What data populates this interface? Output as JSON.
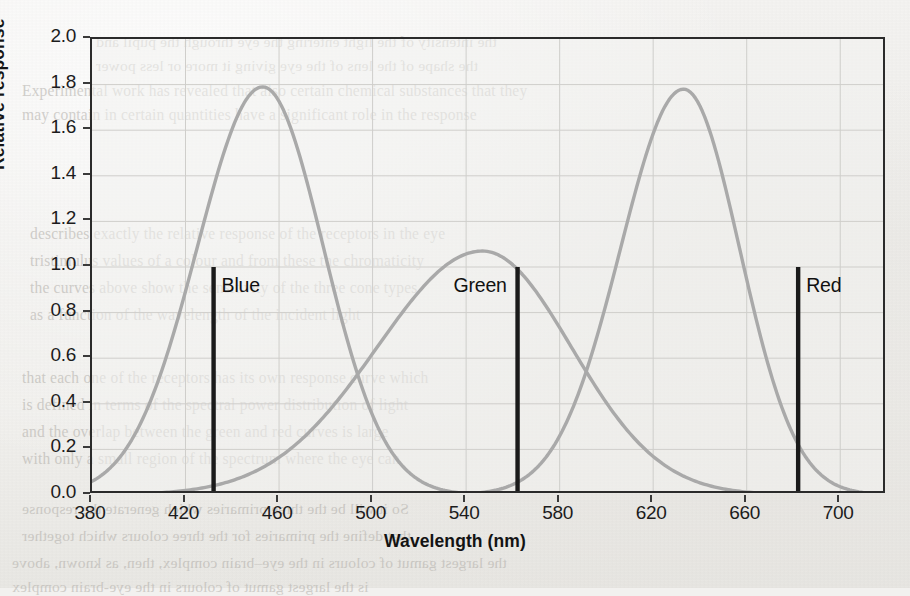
{
  "page": {
    "background_color": "#f1f0ed",
    "ghost_text_color": "#b9b6b1",
    "bleed_lines": [
      {
        "text": "the intensity of the light entering the eye through the pupil and",
        "x": 96,
        "y": 33,
        "flip": true
      },
      {
        "text": "the shape of the lens of the eye giving it more or less power",
        "x": 96,
        "y": 57,
        "flip": true
      },
      {
        "text": "Experimental work has revealed that also certain chemical substances that they",
        "x": 22,
        "y": 82,
        "flip": false
      },
      {
        "text": "may contain in certain quantities have a significant role in the response",
        "x": 22,
        "y": 106,
        "flip": false
      },
      {
        "text": "describes exactly the relative response of the receptors in the eye",
        "x": 30,
        "y": 225,
        "flip": false
      },
      {
        "text": "tristimulus values of a colour and from these the chromaticity",
        "x": 30,
        "y": 252,
        "flip": false
      },
      {
        "text": "the curves above show the sensitivity of the three cone types",
        "x": 30,
        "y": 279,
        "flip": false
      },
      {
        "text": "as a function of the wavelength of the incident light",
        "x": 30,
        "y": 306,
        "flip": false
      },
      {
        "text": "that each one of the receptors has its own response curve which",
        "x": 22,
        "y": 369,
        "flip": false
      },
      {
        "text": "is defined in terms of the spectral power distribution of light",
        "x": 22,
        "y": 396,
        "flip": false
      },
      {
        "text": "and the overlap between the green and red curves is large",
        "x": 22,
        "y": 423,
        "flip": false
      },
      {
        "text": "with only a small region of the spectrum where the eye can",
        "x": 22,
        "y": 450,
        "flip": false
      },
      {
        "text": "So it will be the three primaries which generate the response",
        "x": 22,
        "y": 500,
        "flip": true
      },
      {
        "text": "that define the primaries for the three colours which together",
        "x": 22,
        "y": 527,
        "flip": true
      },
      {
        "text": "the largest gamut of colours in the eye–brain complex, then, as known, above",
        "x": 12,
        "y": 554,
        "flip": true
      },
      {
        "text": "is the largest gamut of colours in the eye-brain complex",
        "x": 12,
        "y": 578,
        "flip": true
      }
    ]
  },
  "chart_data": {
    "type": "line",
    "title": "",
    "xlabel": "Wavelength (nm)",
    "ylabel": "Relative response",
    "xlim": [
      380,
      720
    ],
    "ylim": [
      0.0,
      2.0
    ],
    "grid": true,
    "legend_position": "inline-annotations",
    "xticks": [
      380,
      420,
      460,
      500,
      540,
      580,
      620,
      660,
      700
    ],
    "xtick_labels": [
      "380",
      "420",
      "460",
      "500",
      "540",
      "580",
      "620",
      "660",
      "700"
    ],
    "yticks": [
      0.0,
      0.2,
      0.4,
      0.6,
      0.8,
      1.0,
      1.2,
      1.4,
      1.6,
      1.8,
      2.0
    ],
    "ytick_labels": [
      "0.0",
      "0.2",
      "0.4",
      "0.6",
      "0.8",
      "1.0",
      "1.2",
      "1.4",
      "1.6",
      "1.8",
      "2.0"
    ],
    "curve_color": "#a9a9a9",
    "marker_color": "#1a1a1a",
    "series": [
      {
        "name": "short-wavelength cone response",
        "peak_x": 453,
        "peak_y": 1.79,
        "sigma_left": 28,
        "sigma_right": 26,
        "x": [
          380,
          390,
          400,
          410,
          420,
          430,
          440,
          450,
          453,
          460,
          470,
          480,
          490,
          500,
          510,
          520,
          530,
          540,
          560,
          580,
          600,
          620,
          650,
          700,
          720
        ],
        "y": [
          0.02,
          0.05,
          0.12,
          0.27,
          0.55,
          0.95,
          1.4,
          1.76,
          1.79,
          1.72,
          1.45,
          1.08,
          0.7,
          0.4,
          0.2,
          0.09,
          0.04,
          0.02,
          0.0,
          0.0,
          0.0,
          0.0,
          0.0,
          0.0,
          0.0
        ]
      },
      {
        "name": "medium-wavelength cone response",
        "peak_x": 547,
        "peak_y": 1.07,
        "sigma_left": 45,
        "sigma_right": 38,
        "x": [
          380,
          400,
          420,
          440,
          460,
          470,
          480,
          490,
          500,
          510,
          520,
          530,
          540,
          547,
          555,
          565,
          575,
          585,
          595,
          605,
          615,
          625,
          640,
          660,
          690,
          720
        ],
        "y": [
          0.0,
          0.01,
          0.02,
          0.05,
          0.13,
          0.21,
          0.31,
          0.44,
          0.59,
          0.74,
          0.88,
          0.99,
          1.06,
          1.07,
          1.05,
          0.98,
          0.87,
          0.72,
          0.55,
          0.39,
          0.25,
          0.15,
          0.06,
          0.02,
          0.0,
          0.0
        ]
      },
      {
        "name": "long-wavelength cone response",
        "peak_x": 633,
        "peak_y": 1.78,
        "sigma_left": 27,
        "sigma_right": 24,
        "x": [
          380,
          480,
          520,
          540,
          560,
          570,
          580,
          590,
          600,
          610,
          620,
          630,
          633,
          640,
          650,
          660,
          670,
          680,
          690,
          700,
          710,
          720
        ],
        "y": [
          0.0,
          0.0,
          0.01,
          0.03,
          0.09,
          0.16,
          0.28,
          0.48,
          0.78,
          1.14,
          1.5,
          1.75,
          1.78,
          1.73,
          1.52,
          1.2,
          0.86,
          0.55,
          0.32,
          0.17,
          0.08,
          0.04
        ]
      }
    ],
    "markers": [
      {
        "label": "Blue",
        "x": 432,
        "y_top": 1.0,
        "y_bottom": 0.0,
        "label_offset_x": 10
      },
      {
        "label": "Green",
        "x": 562,
        "y_top": 1.0,
        "y_bottom": 0.0,
        "label_offset_x": -62
      },
      {
        "label": "Red",
        "x": 682,
        "y_top": 1.0,
        "y_bottom": 0.0,
        "label_offset_x": 10
      }
    ]
  }
}
